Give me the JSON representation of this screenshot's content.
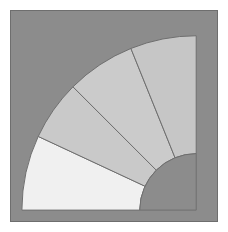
{
  "figure": {
    "kind": "quarter-annulus-sector-diagram",
    "canvas_width": 228,
    "canvas_height": 232,
    "margin": 10,
    "panel_background_color": "#8c8c8c",
    "panel_border_color": "#6e6e6e",
    "page_background_color": "#ffffff"
  },
  "chart_data": {
    "type": "pie",
    "title": "",
    "subtitle": "",
    "xlabel": "",
    "ylabel": "",
    "grid": false,
    "legend_position": "none",
    "variant": "quarter-annulus-donut",
    "center": {
      "x": 197,
      "y": 211
    },
    "inner_radius": 57,
    "outer_radius": 176,
    "angle_start_deg": 180,
    "angle_end_deg": 270,
    "total_sweep_deg": 90,
    "stroke_color": "#6e6e6e",
    "stroke_width": 1,
    "inner_disc": {
      "label": "inner-disc",
      "color": "#8c8c8c",
      "radius": 57
    },
    "outer_background": {
      "label": "outer-background",
      "color": "#8c8c8c"
    },
    "categories": [
      "Sector 1",
      "Sector 2",
      "Sector 3",
      "Sector 4"
    ],
    "values": [
      25,
      20,
      23,
      22
    ],
    "slices": [
      {
        "name": "Sector 1",
        "value": 25,
        "start_deg": 180,
        "end_deg": 205,
        "color": "#f0f0f0"
      },
      {
        "name": "Sector 2",
        "value": 20,
        "start_deg": 205,
        "end_deg": 225,
        "color": "#c9c9c9"
      },
      {
        "name": "Sector 3",
        "value": 23,
        "start_deg": 225,
        "end_deg": 248,
        "color": "#cbcbcb"
      },
      {
        "name": "Sector 4",
        "value": 22,
        "start_deg": 248,
        "end_deg": 270,
        "color": "#c6c6c6"
      }
    ]
  }
}
